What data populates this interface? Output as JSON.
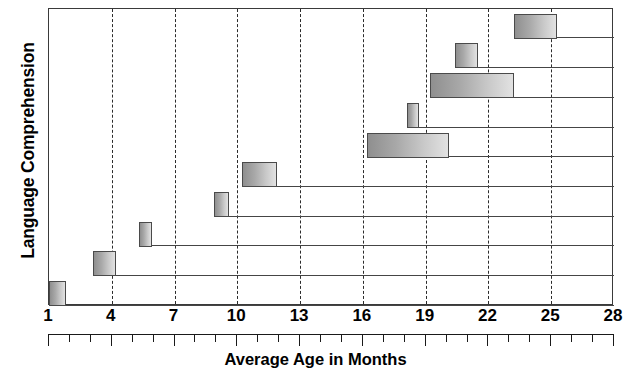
{
  "chart_data": {
    "type": "bar",
    "orientation": "horizontal",
    "title": "",
    "xlabel": "Average Age in Months",
    "ylabel": "Language Comprehension",
    "xlim": [
      1,
      28
    ],
    "xticks": [
      1,
      4,
      7,
      10,
      13,
      16,
      19,
      22,
      25,
      28
    ],
    "xticklabels": [
      "1",
      "4",
      "7",
      "10",
      "13",
      "16",
      "19",
      "22",
      "25",
      "28"
    ],
    "minor_tick_interval": 1,
    "grid": "vertical-dashed-at-major-ticks",
    "legend": "none",
    "bar_style": "range-bars-staircase",
    "categories": [
      "milestone-1",
      "milestone-2",
      "milestone-3",
      "milestone-4",
      "milestone-5",
      "milestone-6",
      "milestone-7",
      "milestone-8",
      "milestone-9",
      "milestone-10"
    ],
    "bars": [
      {
        "row": 1,
        "start": 1.0,
        "end": 1.8,
        "label": ""
      },
      {
        "row": 2,
        "start": 3.1,
        "end": 4.2,
        "label": ""
      },
      {
        "row": 3,
        "start": 5.3,
        "end": 5.9,
        "label": ""
      },
      {
        "row": 4,
        "start": 8.9,
        "end": 9.6,
        "label": ""
      },
      {
        "row": 5,
        "start": 10.2,
        "end": 11.9,
        "label": ""
      },
      {
        "row": 6,
        "start": 16.2,
        "end": 20.1,
        "label": ""
      },
      {
        "row": 7,
        "start": 18.1,
        "end": 18.7,
        "label": ""
      },
      {
        "row": 8,
        "start": 19.2,
        "end": 23.2,
        "label": ""
      },
      {
        "row": 9,
        "start": 20.4,
        "end": 21.5,
        "label": ""
      },
      {
        "row": 10,
        "start": 23.2,
        "end": 25.3,
        "label": ""
      }
    ]
  },
  "axis": {
    "y_title": "Language Comprehension",
    "x_title": "Average Age in Months"
  },
  "colors": {
    "frame": "#3a3a3a",
    "gridline": "#2b2b2b",
    "bar_border": "#4a4a4a",
    "bar_fill_dark": "#8f8f8f",
    "bar_fill_light": "#e2e2e2",
    "text": "#000000",
    "background": "#ffffff"
  }
}
